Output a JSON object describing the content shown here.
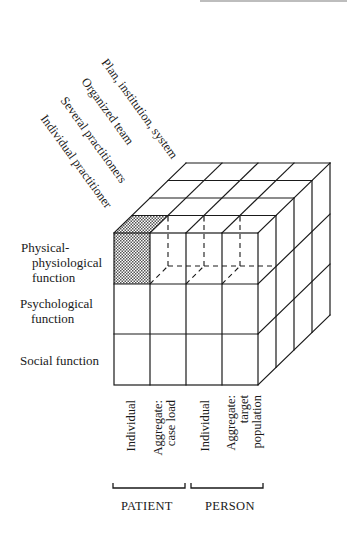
{
  "diagram": {
    "type": "3D matrix cube",
    "depth_axis": {
      "labels": [
        "Plan, institution, system",
        "Organized team",
        "Several practitioners",
        "Individual practitioner"
      ]
    },
    "row_axis": {
      "labels": [
        {
          "line1": "Physical-",
          "line2": "physiological",
          "line3": "function"
        },
        {
          "line1": "Psychological",
          "line2": "function"
        },
        {
          "line1": "Social function"
        }
      ]
    },
    "column_axis": {
      "labels": [
        {
          "line1": "Individual"
        },
        {
          "line1": "Aggregate:",
          "line2": "case load"
        },
        {
          "line1": "Individual"
        },
        {
          "line1": "Aggregate:",
          "line2": "target",
          "line3": "population"
        }
      ],
      "groups": [
        {
          "label": "PATIENT"
        },
        {
          "label": "PERSON"
        }
      ]
    },
    "highlighted_cell": "Individual practitioner × Physical-physiological function × Patient Individual",
    "colors": {
      "line": "#1a1a1a",
      "shade": "#8a8a8a",
      "background": "#ffffff"
    }
  }
}
